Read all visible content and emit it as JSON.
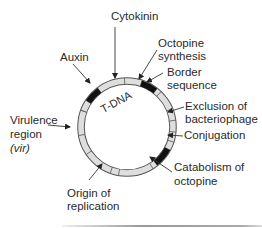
{
  "diagram": {
    "ring_label": "T-DNA",
    "colors": {
      "ring_fill": "#dedede",
      "ring_stroke": "#555555",
      "gene_fill": "#111111",
      "arrow": "#333333"
    },
    "labels": {
      "cytokinin": "Cytokinin",
      "auxin": "Auxin",
      "octopine_synthesis_1": "Octopine",
      "octopine_synthesis_2": "synthesis",
      "border_sequence_1": "Border",
      "border_sequence_2": "sequence",
      "exclusion_1": "Exclusion of",
      "exclusion_2": "bacteriophage",
      "conjugation": "Conjugation",
      "catabolism_1": "Catabolism of",
      "catabolism_2": "octopine",
      "origin_1": "Origin of",
      "origin_2": "replication",
      "virulence_1": "Virulence",
      "virulence_2": "region",
      "virulence_3": "(vir)"
    }
  }
}
